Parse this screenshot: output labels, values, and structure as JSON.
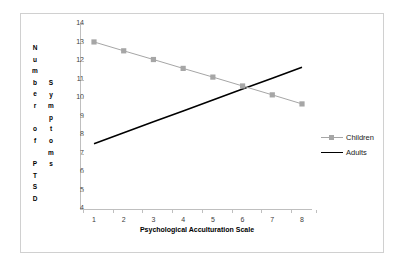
{
  "chart_data": {
    "type": "line",
    "title": "",
    "xlabel": "Psychological Acculturation Scale",
    "ylabel": "Number of PTSD Symptoms",
    "ylabel_columns": [
      "Number of PTSD",
      "Symptoms"
    ],
    "x": [
      1,
      2,
      3,
      4,
      5,
      6,
      7,
      8
    ],
    "xlim": [
      1,
      8
    ],
    "ylim": [
      4,
      14
    ],
    "yticks": [
      4,
      5,
      6,
      7,
      8,
      9,
      10,
      11,
      12,
      13,
      14
    ],
    "xticks": [
      1,
      2,
      3,
      4,
      5,
      6,
      7,
      8
    ],
    "grid": false,
    "legend_position": "right",
    "series": [
      {
        "name": "Children",
        "color": "#a6a6a6",
        "marker": "square",
        "values": [
          13.03,
          12.55,
          12.08,
          11.6,
          11.13,
          10.65,
          10.17,
          9.68
        ]
      },
      {
        "name": "Adults",
        "color": "#000000",
        "marker": "none",
        "values": [
          7.53,
          8.12,
          8.71,
          9.3,
          9.89,
          10.48,
          11.07,
          11.66
        ]
      }
    ]
  },
  "axes": {
    "y_tick_labels": [
      "14",
      "13",
      "12",
      "11",
      "10",
      "9",
      "8",
      "7",
      "6",
      "5",
      "4"
    ],
    "x_tick_labels": [
      "1",
      "2",
      "3",
      "4",
      "5",
      "6",
      "7",
      "8"
    ],
    "x_axis_title": "Psychological Acculturation Scale",
    "y_axis_title_col1_chars": [
      "N",
      "u",
      "m",
      "b",
      "e",
      "r",
      "",
      "o",
      "f",
      "",
      "P",
      "T",
      "S",
      "D"
    ],
    "y_axis_title_col2_chars": [
      "S",
      "y",
      "m",
      "p",
      "t",
      "o",
      "m",
      "s"
    ]
  },
  "legend": {
    "items": [
      {
        "label": "Children",
        "key_type": "line-with-square-marker",
        "color": "#a6a6a6"
      },
      {
        "label": "Adults",
        "key_type": "solid-line",
        "color": "#000000"
      }
    ]
  },
  "colors": {
    "children_series": "#a6a6a6",
    "adults_series": "#000000",
    "axis_line": "#bfbfbf",
    "tick_text": "#404040",
    "figure_border": "#d0d0d0",
    "background": "#ffffff"
  }
}
